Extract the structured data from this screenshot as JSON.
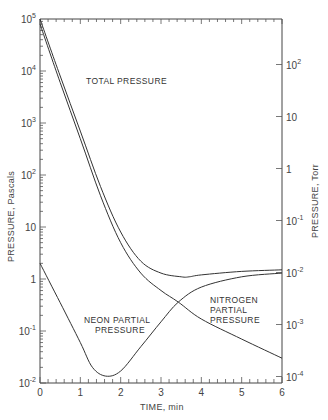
{
  "chart_data": {
    "type": "line",
    "title": "",
    "xlabel": "TIME, min",
    "ylabel": "PRESSURE, Pascals",
    "ylabel_right": "PRESSURE, Torr",
    "xlim": [
      0,
      6
    ],
    "ylim": [
      0.01,
      100000
    ],
    "yscale": "log",
    "grid": false,
    "x_ticks": [
      "0",
      "1",
      "2",
      "3",
      "4",
      "5",
      "6"
    ],
    "y_ticks_left": [
      "10^5",
      "10^4",
      "10^3",
      "10^2",
      "10",
      "1",
      "10^-1",
      "10^-2"
    ],
    "y_ticks_right": [
      "10^2",
      "10",
      "1",
      "10^-1",
      "10^-2",
      "10^-3",
      "10^-4"
    ],
    "series": [
      {
        "name": "TOTAL PRESSURE",
        "x": [
          0,
          0.5,
          1.0,
          1.5,
          2.0,
          2.5,
          3.0,
          3.5,
          3.7,
          4.0,
          5.0,
          6.0
        ],
        "values": [
          100000,
          8000,
          700,
          60,
          8,
          2.2,
          1.3,
          1.1,
          1.1,
          1.2,
          1.4,
          1.5
        ]
      },
      {
        "name": "NITROGEN PARTIAL PRESSURE",
        "x": [
          0,
          0.5,
          1.0,
          1.5,
          2.0,
          2.5,
          3.0,
          3.43,
          4.0,
          5.0,
          6.0
        ],
        "values": [
          80000,
          6000,
          500,
          40,
          5,
          1.3,
          0.6,
          0.36,
          0.17,
          0.07,
          0.03
        ]
      },
      {
        "name": "NEON PARTIAL PRESSURE",
        "x": [
          0,
          0.5,
          1.0,
          1.3,
          1.63,
          2.0,
          2.5,
          3.0,
          3.43,
          4.0,
          5.0,
          6.0
        ],
        "values": [
          2,
          0.35,
          0.06,
          0.02,
          0.0136,
          0.017,
          0.05,
          0.15,
          0.36,
          0.7,
          1.1,
          1.3
        ]
      }
    ],
    "annotations": [
      "TOTAL PRESSURE",
      "NEON PARTIAL PRESSURE",
      "NITROGEN PARTIAL PRESSURE"
    ]
  },
  "labels": {
    "xlabel": "TIME, min",
    "ylabel_left": "PRESSURE, Pascals",
    "ylabel_right": "PRESSURE, Torr",
    "total": "TOTAL PRESSURE",
    "neon_1": "NEON PARTIAL",
    "neon_2": "PRESSURE",
    "nitro_1": "NITROGEN",
    "nitro_2": "PARTIAL",
    "nitro_3": "PRESSURE"
  },
  "ticks": {
    "x": [
      "0",
      "1",
      "2",
      "3",
      "4",
      "5",
      "6"
    ],
    "left": [
      {
        "base": "10",
        "exp": "5"
      },
      {
        "base": "10",
        "exp": "4"
      },
      {
        "base": "10",
        "exp": "3"
      },
      {
        "base": "10",
        "exp": "2"
      },
      {
        "base": "10",
        "exp": ""
      },
      {
        "base": "1",
        "exp": ""
      },
      {
        "base": "10",
        "exp": "-1"
      },
      {
        "base": "10",
        "exp": "-2"
      }
    ],
    "right": [
      {
        "base": "10",
        "exp": "2"
      },
      {
        "base": "10",
        "exp": ""
      },
      {
        "base": "1",
        "exp": ""
      },
      {
        "base": "10",
        "exp": "-1"
      },
      {
        "base": "10",
        "exp": "-2"
      },
      {
        "base": "10",
        "exp": "-3"
      },
      {
        "base": "10",
        "exp": "-4"
      }
    ]
  }
}
